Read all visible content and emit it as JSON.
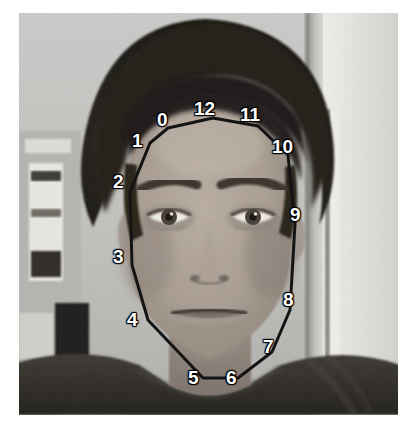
{
  "image": {
    "kind": "photograph",
    "description": "Grayscale indoor portrait photograph of a man facing the camera, annotated with numbered facial landmark points connected by a black contour line",
    "colorspace": "grayscale",
    "canvas": {
      "width": 416,
      "height": 429,
      "background": "#ffffff"
    },
    "photo_frame": {
      "left": 19,
      "top": 13,
      "width": 379,
      "height": 402
    },
    "scene": {
      "subject": "adult man with dark curly hair, plain expression, wearing a dark t-shirt",
      "background": "light grey interior wall with a small framed picture on the left, a bookshelf with books at far left, and a bright doorway edge at the right"
    }
  },
  "annotation": {
    "type": "face-contour-landmarks",
    "label_color": "#ffffff",
    "line_color": "#141414",
    "line_width": 3,
    "point_count": 13,
    "points": [
      {
        "id": "0",
        "label": "0",
        "x": 168,
        "y": 128,
        "label_x": 157,
        "label_y": 110
      },
      {
        "id": "1",
        "label": "1",
        "x": 150,
        "y": 143,
        "label_x": 132,
        "label_y": 131
      },
      {
        "id": "2",
        "label": "2",
        "x": 130,
        "y": 192,
        "label_x": 113,
        "label_y": 172
      },
      {
        "id": "3",
        "label": "3",
        "x": 132,
        "y": 265,
        "label_x": 113,
        "label_y": 247
      },
      {
        "id": "4",
        "label": "4",
        "x": 148,
        "y": 320,
        "label_x": 127,
        "label_y": 310
      },
      {
        "id": "5",
        "label": "5",
        "x": 203,
        "y": 378,
        "label_x": 188,
        "label_y": 368
      },
      {
        "id": "6",
        "label": "6",
        "x": 238,
        "y": 378,
        "label_x": 226,
        "label_y": 368
      },
      {
        "id": "7",
        "label": "7",
        "x": 272,
        "y": 352,
        "label_x": 263,
        "label_y": 337
      },
      {
        "id": "8",
        "label": "8",
        "x": 290,
        "y": 310,
        "label_x": 283,
        "label_y": 290
      },
      {
        "id": "9",
        "label": "9",
        "x": 295,
        "y": 224,
        "label_x": 290,
        "label_y": 205
      },
      {
        "id": "10",
        "label": "10",
        "x": 288,
        "y": 155,
        "label_x": 272,
        "label_y": 137
      },
      {
        "id": "11",
        "label": "11",
        "x": 258,
        "y": 126,
        "label_x": 240,
        "label_y": 105
      },
      {
        "id": "12",
        "label": "12",
        "x": 213,
        "y": 118,
        "label_x": 194,
        "label_y": 99
      }
    ],
    "contour_path": "M 168 128 L 150 143 L 130 192 L 132 265 L 148 320 L 203 378 L 238 378 L 272 352 L 290 310 L 295 224 L 288 155 L 258 126 L 213 118 Z"
  }
}
